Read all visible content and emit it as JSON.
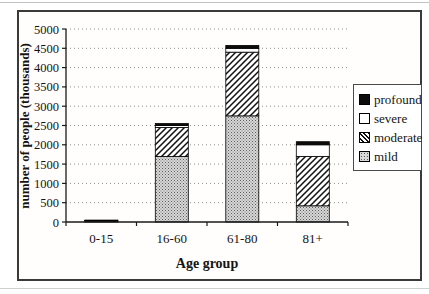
{
  "figure": {
    "x_axis_label": "Age group",
    "y_axis_label": "number of people (thousands)"
  },
  "chart_data": {
    "type": "bar",
    "stacked": true,
    "title": "",
    "xlabel": "Age group",
    "ylabel": "number of people (thousands)",
    "categories": [
      "0-15",
      "16-60",
      "61-80",
      "81+"
    ],
    "series": [
      {
        "name": "mild",
        "pattern": "speckle",
        "values": [
          20,
          1700,
          2750,
          420
        ]
      },
      {
        "name": "moderate",
        "pattern": "diagonal-hatch",
        "values": [
          10,
          750,
          1650,
          1280
        ]
      },
      {
        "name": "severe",
        "pattern": "white",
        "values": [
          10,
          50,
          100,
          300
        ]
      },
      {
        "name": "profound",
        "pattern": "black",
        "values": [
          10,
          50,
          75,
          80
        ]
      }
    ],
    "stack_order": "bottom-to-top",
    "totals": [
      50,
      2550,
      4575,
      2080
    ],
    "ylim": [
      0,
      5000
    ],
    "ytick_step": 500,
    "grid": "horizontal-dotted",
    "legend_position": "right",
    "legend": [
      {
        "label": "profound",
        "pattern": "black"
      },
      {
        "label": "severe",
        "pattern": "white"
      },
      {
        "label": "moderate",
        "pattern": "diagonal-hatch"
      },
      {
        "label": "mild",
        "pattern": "speckle"
      }
    ]
  },
  "colors": {
    "bar_black": "#0c0c0c",
    "bar_white": "#ffffff",
    "bar_outline": "#000000",
    "hatch_line": "#111111",
    "speckle_base": "#d7d7d7",
    "grid": "#8f8f8f",
    "axis": "#1a1a1a",
    "frame": "#3a3a3a"
  }
}
